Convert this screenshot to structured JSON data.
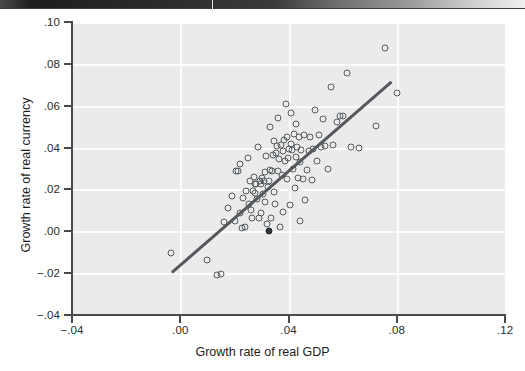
{
  "page": {
    "background": "#ffffff",
    "artifact_band": "dark-scan-edge"
  },
  "figure": {
    "plot_background": "#ebebeb",
    "gridline_color": "#fdfdfd",
    "axis_color": "#4a4a4a",
    "marker_color": "#555a5e",
    "fitline_color": "#55585c"
  },
  "chart_data": {
    "type": "scatter",
    "title": "",
    "subtitle": "",
    "xlabel": "Growth rate of real GDP",
    "ylabel": "Growth rate of real currency",
    "xlim": [
      -0.04,
      0.12
    ],
    "ylim": [
      -0.04,
      0.1
    ],
    "xticks": [
      -0.04,
      0.0,
      0.04,
      0.08,
      0.12
    ],
    "xticklabels": [
      "-.04",
      ".00",
      ".04",
      ".08",
      ".12"
    ],
    "yticks": [
      -0.04,
      -0.02,
      0.0,
      0.02,
      0.04,
      0.06,
      0.08,
      0.1
    ],
    "yticklabels": [
      "-.04",
      "-.02",
      ".00",
      ".02",
      ".04",
      ".06",
      ".08",
      ".10"
    ],
    "grid": true,
    "grid_style": "white lines on light gray panel",
    "legend": null,
    "marker": "open circle",
    "n_points": 108,
    "points": [
      {
        "x": -0.0035,
        "y": -0.0106
      },
      {
        "x": 0.0097,
        "y": -0.0137
      },
      {
        "x": 0.0135,
        "y": -0.0207
      },
      {
        "x": 0.015,
        "y": -0.0202
      },
      {
        "x": 0.0163,
        "y": 0.0046
      },
      {
        "x": 0.0176,
        "y": 0.011
      },
      {
        "x": 0.019,
        "y": 0.0168
      },
      {
        "x": 0.0201,
        "y": 0.0047
      },
      {
        "x": 0.0207,
        "y": 0.0287
      },
      {
        "x": 0.0214,
        "y": 0.0286
      },
      {
        "x": 0.0219,
        "y": 0.032
      },
      {
        "x": 0.0222,
        "y": 0.0085
      },
      {
        "x": 0.0228,
        "y": 0.0016
      },
      {
        "x": 0.0233,
        "y": 0.0157
      },
      {
        "x": 0.0239,
        "y": 0.002
      },
      {
        "x": 0.0244,
        "y": 0.0192
      },
      {
        "x": 0.0249,
        "y": 0.035
      },
      {
        "x": 0.0253,
        "y": 0.0131
      },
      {
        "x": 0.0258,
        "y": 0.0238
      },
      {
        "x": 0.0262,
        "y": 0.01
      },
      {
        "x": 0.0266,
        "y": 0.0065
      },
      {
        "x": 0.0269,
        "y": 0.0191
      },
      {
        "x": 0.0272,
        "y": 0.0258
      },
      {
        "x": 0.0275,
        "y": 0.0181
      },
      {
        "x": 0.0278,
        "y": 0.0226
      },
      {
        "x": 0.0281,
        "y": 0.0228
      },
      {
        "x": 0.0285,
        "y": 0.0152
      },
      {
        "x": 0.0288,
        "y": 0.0405
      },
      {
        "x": 0.0291,
        "y": 0.0064
      },
      {
        "x": 0.0294,
        "y": 0.024
      },
      {
        "x": 0.0297,
        "y": 0.0088
      },
      {
        "x": 0.03,
        "y": 0.0226
      },
      {
        "x": 0.0303,
        "y": 0.0253
      },
      {
        "x": 0.0306,
        "y": 0.0179
      },
      {
        "x": 0.0309,
        "y": 0.024
      },
      {
        "x": 0.0312,
        "y": 0.0141
      },
      {
        "x": 0.0315,
        "y": 0.0285
      },
      {
        "x": 0.0318,
        "y": 0.036
      },
      {
        "x": 0.0321,
        "y": 0.0033
      },
      {
        "x": 0.0324,
        "y": 0.0213
      },
      {
        "x": 0.0327,
        "y": 0.0241
      },
      {
        "x": 0.033,
        "y": 0.0291
      },
      {
        "x": 0.0333,
        "y": 0.05
      },
      {
        "x": 0.0336,
        "y": 0.0062
      },
      {
        "x": 0.0339,
        "y": 0.0288
      },
      {
        "x": 0.0342,
        "y": 0.0364
      },
      {
        "x": 0.0345,
        "y": 0.0187
      },
      {
        "x": 0.0348,
        "y": 0.0433
      },
      {
        "x": 0.0351,
        "y": 0.0131
      },
      {
        "x": 0.0354,
        "y": 0.0372
      },
      {
        "x": 0.0357,
        "y": 0.0407
      },
      {
        "x": 0.036,
        "y": 0.029
      },
      {
        "x": 0.0363,
        "y": 0.054
      },
      {
        "x": 0.0366,
        "y": 0.0346
      },
      {
        "x": 0.0369,
        "y": 0.002
      },
      {
        "x": 0.0372,
        "y": 0.0414
      },
      {
        "x": 0.0375,
        "y": 0.0268
      },
      {
        "x": 0.0378,
        "y": 0.0094
      },
      {
        "x": 0.0381,
        "y": 0.0385
      },
      {
        "x": 0.0384,
        "y": 0.0436
      },
      {
        "x": 0.0387,
        "y": 0.0336
      },
      {
        "x": 0.039,
        "y": 0.0607
      },
      {
        "x": 0.0393,
        "y": 0.0251
      },
      {
        "x": 0.0396,
        "y": 0.0452
      },
      {
        "x": 0.0399,
        "y": 0.0352
      },
      {
        "x": 0.0402,
        "y": 0.0391
      },
      {
        "x": 0.0405,
        "y": 0.0124
      },
      {
        "x": 0.0408,
        "y": 0.0566
      },
      {
        "x": 0.0411,
        "y": 0.0418
      },
      {
        "x": 0.0414,
        "y": 0.039
      },
      {
        "x": 0.0417,
        "y": 0.03
      },
      {
        "x": 0.042,
        "y": 0.0466
      },
      {
        "x": 0.0423,
        "y": 0.0206
      },
      {
        "x": 0.0426,
        "y": 0.0357
      },
      {
        "x": 0.0429,
        "y": 0.0514
      },
      {
        "x": 0.0432,
        "y": 0.0403
      },
      {
        "x": 0.0435,
        "y": 0.0253
      },
      {
        "x": 0.0438,
        "y": 0.045
      },
      {
        "x": 0.0441,
        "y": 0.0049
      },
      {
        "x": 0.0444,
        "y": 0.033
      },
      {
        "x": 0.0447,
        "y": 0.039
      },
      {
        "x": 0.0452,
        "y": 0.0248
      },
      {
        "x": 0.0457,
        "y": 0.046
      },
      {
        "x": 0.0462,
        "y": 0.0148
      },
      {
        "x": 0.0468,
        "y": 0.0293
      },
      {
        "x": 0.0474,
        "y": 0.0382
      },
      {
        "x": 0.048,
        "y": 0.0452
      },
      {
        "x": 0.0486,
        "y": 0.0246
      },
      {
        "x": 0.0492,
        "y": 0.0394
      },
      {
        "x": 0.0498,
        "y": 0.0578
      },
      {
        "x": 0.0505,
        "y": 0.0334
      },
      {
        "x": 0.0512,
        "y": 0.0461
      },
      {
        "x": 0.052,
        "y": 0.0402
      },
      {
        "x": 0.0528,
        "y": 0.0536
      },
      {
        "x": 0.0536,
        "y": 0.0409
      },
      {
        "x": 0.0545,
        "y": 0.03
      },
      {
        "x": 0.0556,
        "y": 0.069
      },
      {
        "x": 0.0566,
        "y": 0.0411
      },
      {
        "x": 0.0578,
        "y": 0.0524
      },
      {
        "x": 0.059,
        "y": 0.055
      },
      {
        "x": 0.0602,
        "y": 0.0553
      },
      {
        "x": 0.0615,
        "y": 0.0758
      },
      {
        "x": 0.0632,
        "y": 0.0403
      },
      {
        "x": 0.066,
        "y": 0.04
      },
      {
        "x": 0.0723,
        "y": 0.0503
      },
      {
        "x": 0.0757,
        "y": 0.0875
      },
      {
        "x": 0.08,
        "y": 0.0662
      },
      {
        "x": 0.0328,
        "y": 0.0003
      }
    ],
    "filled_point": {
      "x": 0.0328,
      "y": 0.0003
    },
    "fit_line": {
      "label": "linear fit",
      "x0": -0.0031,
      "y0": -0.019,
      "x1": 0.078,
      "y1": 0.072
    }
  }
}
